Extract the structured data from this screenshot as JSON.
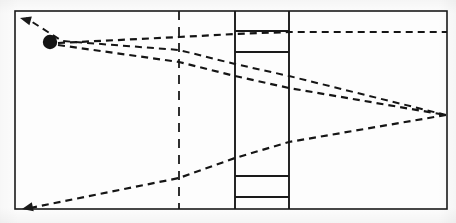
{
  "figure": {
    "kind": "optical-ray-diagram",
    "width": 456,
    "height": 223,
    "background_color": "#fdfdfd",
    "ink_color": "#1a1a1a"
  },
  "frame": {
    "label": "outer-frame",
    "x": 15,
    "y": 11,
    "width": 432,
    "height": 198,
    "stroke_width": 1.6,
    "color": "#1a1a1a"
  },
  "source_point": {
    "label": "point-source",
    "cx": 50,
    "cy": 42,
    "r": 7.2,
    "color": "#141414"
  },
  "reference_line": {
    "label": "dashed-vertical-reference",
    "x": 179,
    "y_top": 11,
    "y_bottom": 209,
    "stroke_width": 1.8,
    "dash": "9 7",
    "color": "#1a1a1a"
  },
  "column": {
    "label": "central-column",
    "x_left": 235,
    "x_right": 289,
    "y_top": 11,
    "y_bottom": 209,
    "stroke_width": 1.9,
    "color": "#1a1a1a",
    "dividers": [
      {
        "label": "divider-upper-a",
        "y": 31
      },
      {
        "label": "divider-upper-b",
        "y": 52
      },
      {
        "label": "divider-lower-a",
        "y": 176
      },
      {
        "label": "divider-lower-b",
        "y": 197
      }
    ]
  },
  "rays": [
    {
      "label": "ray-upper-exit-left",
      "points": [
        [
          446,
          115
        ],
        [
          289,
          76
        ],
        [
          235,
          64
        ],
        [
          179,
          50
        ],
        [
          62,
          41
        ],
        [
          26,
          18
        ]
      ],
      "dash": "7 5",
      "stroke_width": 2.0,
      "color": "#151515"
    },
    {
      "label": "ray-upper-source-to-right",
      "points": [
        [
          58,
          43
        ],
        [
          179,
          37
        ],
        [
          235,
          34
        ],
        [
          289,
          32
        ],
        [
          447,
          32
        ]
      ],
      "dash": "7 5",
      "stroke_width": 2.2,
      "color": "#151515"
    },
    {
      "label": "ray-lower-source-to-right",
      "points": [
        [
          58,
          45
        ],
        [
          179,
          62
        ],
        [
          235,
          76
        ],
        [
          289,
          88
        ],
        [
          446,
          115
        ]
      ],
      "dash": "7 5",
      "stroke_width": 2.2,
      "color": "#151515"
    },
    {
      "label": "ray-lower-exit-left",
      "points": [
        [
          446,
          115
        ],
        [
          289,
          142
        ],
        [
          235,
          158
        ],
        [
          179,
          178
        ],
        [
          30,
          208
        ]
      ],
      "dash": "7 5",
      "stroke_width": 2.2,
      "color": "#151515"
    }
  ],
  "arrowheads": [
    {
      "label": "arrowhead-top-left",
      "x": 20,
      "y": 18,
      "angle": 195
    },
    {
      "label": "arrowhead-bottom-left",
      "x": 22,
      "y": 209,
      "angle": 168
    }
  ],
  "convergence_point": {
    "label": "right-convergence-node",
    "x": 446,
    "y": 115
  }
}
